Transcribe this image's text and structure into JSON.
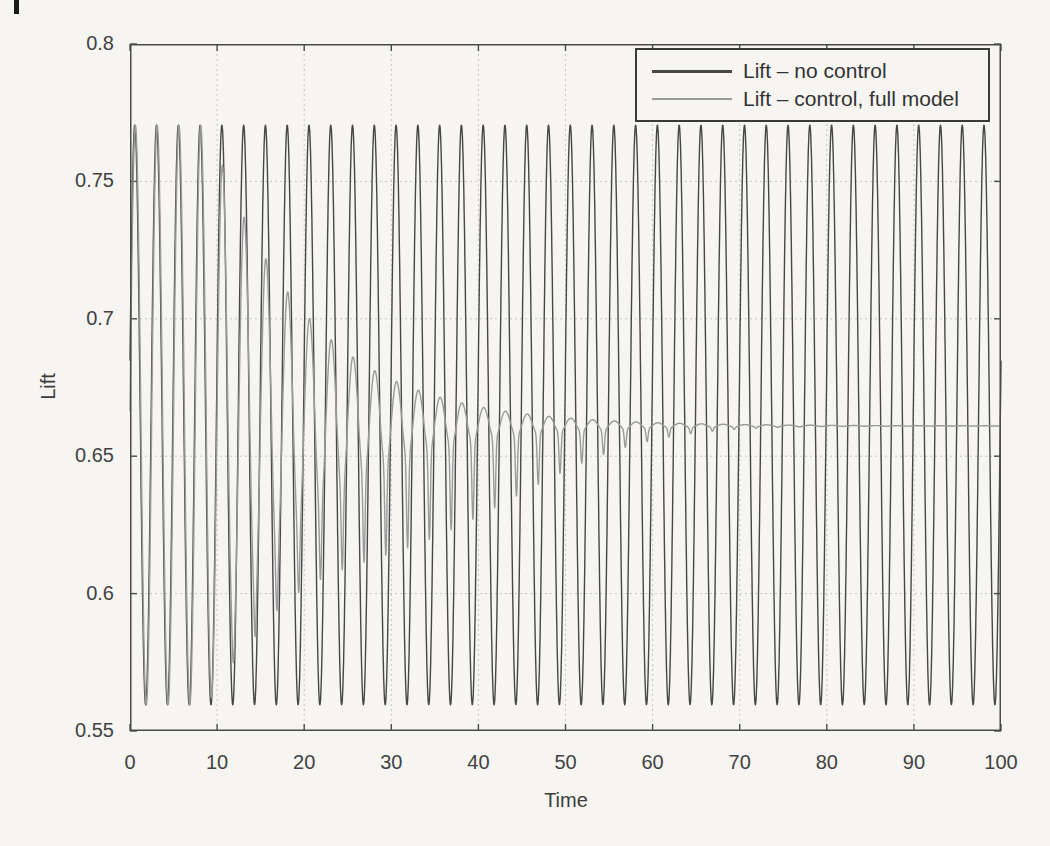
{
  "page": {
    "background_color": "#f6f5f2",
    "page_edge_mark": "black tick at top-left of scanned page"
  },
  "chart_data": {
    "type": "line",
    "title": "",
    "xlabel": "Time",
    "ylabel": "Lift",
    "xlim": [
      0,
      100
    ],
    "ylim": [
      0.55,
      0.8
    ],
    "grid": true,
    "grid_style": "dotted",
    "grid_color": "#c4c4c4",
    "axis_color": "#4a4a4a",
    "text_color": "#424242",
    "legend_position": "top-right",
    "sample_step": 0.04,
    "x_ticks": {
      "values": [
        0,
        10,
        20,
        30,
        40,
        50,
        60,
        70,
        80,
        90,
        100
      ],
      "labels": [
        "0",
        "10",
        "20",
        "30",
        "40",
        "50",
        "60",
        "70",
        "80",
        "90",
        "100"
      ]
    },
    "y_ticks": {
      "values": [
        0.55,
        0.6,
        0.65,
        0.7,
        0.75,
        0.8
      ],
      "labels": [
        "0.55",
        "0.6",
        "0.65",
        "0.7",
        "0.75",
        "0.8"
      ]
    },
    "series": [
      {
        "name": "Lift – no control",
        "color": "#474747",
        "width": 1.4,
        "legend_line_px": 3,
        "model": {
          "kind": "sine",
          "mean": 0.665,
          "amplitude": 0.1055,
          "period": 2.5,
          "peak_time": 0.55
        },
        "summary": "constant oscillation between 0.56 and 0.77 for all t in [0,100]"
      },
      {
        "name": "Lift – control, full model",
        "color": "#9a9a9a",
        "width": 1.4,
        "legend_line_px": 2,
        "model": {
          "kind": "damped-sine",
          "mean_start": 0.665,
          "mean_end": 0.661,
          "amplitude": 0.1055,
          "period": 2.5,
          "peak_time": 0.62,
          "decay_start": 9,
          "amp_decay_rate": 0.09,
          "mean_decay_rate": 0.06,
          "spike_amp": 0.032,
          "spike_center": 32,
          "spike_sigma": 14,
          "spike_power": 12
        },
        "envelope_peaks": [
          [
            9,
            0.77
          ],
          [
            12,
            0.744
          ],
          [
            14,
            0.729
          ],
          [
            17,
            0.717
          ],
          [
            20,
            0.707
          ],
          [
            22,
            0.701
          ],
          [
            25,
            0.692
          ],
          [
            27,
            0.688
          ],
          [
            30,
            0.684
          ],
          [
            35,
            0.676
          ],
          [
            40,
            0.668
          ],
          [
            45,
            0.665
          ],
          [
            50,
            0.663
          ],
          [
            60,
            0.661
          ],
          [
            100,
            0.661
          ]
        ],
        "envelope_dips": [
          [
            12,
            0.585
          ],
          [
            20,
            0.608
          ],
          [
            30,
            0.615
          ],
          [
            35,
            0.622
          ],
          [
            40,
            0.631
          ],
          [
            45,
            0.645
          ],
          [
            50,
            0.648
          ],
          [
            55,
            0.653
          ],
          [
            60,
            0.657
          ],
          [
            100,
            0.661
          ]
        ],
        "summary": "matches uncontrolled oscillation until t~9, then decays with sharp downward spikes, settling to 0.661 by t~60"
      }
    ]
  }
}
